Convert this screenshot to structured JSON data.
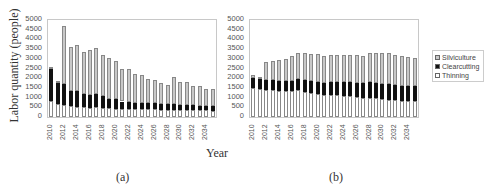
{
  "ylabel": "Labor quantity (people)",
  "xlabel": "Year",
  "captions": [
    "(a)",
    "(b)"
  ],
  "legend": [
    {
      "label": "Silviculture",
      "color": "#c8c8c8"
    },
    {
      "label": "Clearcutting",
      "color": "#111111"
    },
    {
      "label": "Thinning",
      "color": "#ffffff"
    }
  ],
  "chart_data": [
    {
      "type": "bar",
      "stacked": true,
      "title": "(a)",
      "xlabel": "Year",
      "ylabel": "Labor quantity (people)",
      "ylim": [
        0,
        5000
      ],
      "yticks": [
        0,
        500,
        1000,
        1500,
        2000,
        2500,
        3000,
        3500,
        4000,
        4500,
        5000
      ],
      "xtick_labels": [
        "2010",
        "2012",
        "2014",
        "2016",
        "2018",
        "2020",
        "2022",
        "2024",
        "2026",
        "2028",
        "2030",
        "2032",
        "2034"
      ],
      "categories": [
        "2010",
        "2011",
        "2012",
        "2013",
        "2014",
        "2015",
        "2016",
        "2017",
        "2018",
        "2019",
        "2020",
        "2021",
        "2022",
        "2023",
        "2024",
        "2025",
        "2026",
        "2027",
        "2028",
        "2029",
        "2030",
        "2031",
        "2032",
        "2033",
        "2034",
        "2035"
      ],
      "series": [
        {
          "name": "Thinning",
          "values": [
            800,
            680,
            600,
            550,
            520,
            500,
            480,
            500,
            460,
            440,
            430,
            420,
            410,
            400,
            400,
            390,
            390,
            380,
            380,
            370,
            360,
            350,
            340,
            340,
            340,
            330
          ]
        },
        {
          "name": "Clearcutting",
          "values": [
            1650,
            1070,
            1100,
            800,
            800,
            700,
            670,
            680,
            620,
            510,
            490,
            380,
            370,
            320,
            320,
            310,
            330,
            310,
            300,
            310,
            280,
            270,
            260,
            240,
            240,
            240
          ]
        },
        {
          "name": "Silviculture",
          "values": [
            150,
            100,
            3000,
            2250,
            2380,
            2150,
            2330,
            2370,
            2120,
            2100,
            1980,
            1700,
            1670,
            1480,
            1430,
            1250,
            1180,
            1060,
            970,
            1370,
            1160,
            1160,
            1020,
            1000,
            880,
            880
          ]
        }
      ]
    },
    {
      "type": "bar",
      "stacked": true,
      "title": "(b)",
      "xlabel": "Year",
      "ylabel": "Labor quantity (people)",
      "ylim": [
        0,
        5000
      ],
      "yticks": [
        0,
        500,
        1000,
        1500,
        2000,
        2500,
        3000,
        3500,
        4000,
        4500,
        5000
      ],
      "xtick_labels": [
        "2010",
        "2012",
        "2014",
        "2016",
        "2018",
        "2020",
        "2022",
        "2024",
        "2026",
        "2028",
        "2030",
        "2032",
        "2034"
      ],
      "categories": [
        "2010",
        "2011",
        "2012",
        "2013",
        "2014",
        "2015",
        "2016",
        "2017",
        "2018",
        "2019",
        "2020",
        "2021",
        "2022",
        "2023",
        "2024",
        "2025",
        "2026",
        "2027",
        "2028",
        "2029",
        "2030",
        "2031",
        "2032",
        "2033",
        "2034",
        "2035"
      ],
      "series": [
        {
          "name": "Thinning",
          "values": [
            1500,
            1450,
            1400,
            1400,
            1350,
            1330,
            1330,
            1380,
            1300,
            1250,
            1200,
            1150,
            1150,
            1120,
            1100,
            1080,
            1050,
            1000,
            1000,
            980,
            950,
            900,
            880,
            850,
            820,
            800
          ]
        },
        {
          "name": "Clearcutting",
          "values": [
            500,
            500,
            500,
            530,
            530,
            550,
            550,
            570,
            600,
            600,
            620,
            600,
            650,
            680,
            680,
            700,
            710,
            760,
            780,
            770,
            770,
            800,
            770,
            770,
            780,
            780
          ]
        },
        {
          "name": "Silviculture",
          "values": [
            150,
            100,
            950,
            970,
            1070,
            1120,
            1270,
            1350,
            1380,
            1400,
            1430,
            1400,
            1400,
            1400,
            1420,
            1420,
            1440,
            1390,
            1520,
            1550,
            1560,
            1580,
            1530,
            1530,
            1500,
            1450
          ]
        }
      ]
    }
  ]
}
